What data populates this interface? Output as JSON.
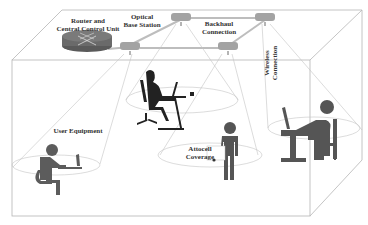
{
  "diagram": {
    "labels": {
      "router": [
        "Router and",
        "Central Control Unit"
      ],
      "obs": [
        "Optical",
        "Base Station"
      ],
      "backhaul": [
        "Backhaul",
        "Connection"
      ],
      "wireless": [
        "Wireless",
        "Connection"
      ],
      "user_equipment": "User Equipment",
      "attocell": [
        "Attocell",
        "Coverage"
      ]
    },
    "colors": {
      "edge": "#b0b0b0",
      "figure": "#555555",
      "figure_dark": "#222222",
      "router": "#666666",
      "base_station": "#999999",
      "ellipse": "#c8c8c8"
    },
    "elements": {
      "router": "router-icon",
      "base_stations": [
        "optical-base-station-1",
        "optical-base-station-2",
        "optical-base-station-3",
        "optical-base-station-4"
      ],
      "users": [
        "seated-user-left",
        "seated-woman-center",
        "standing-user",
        "seated-user-right"
      ]
    }
  }
}
